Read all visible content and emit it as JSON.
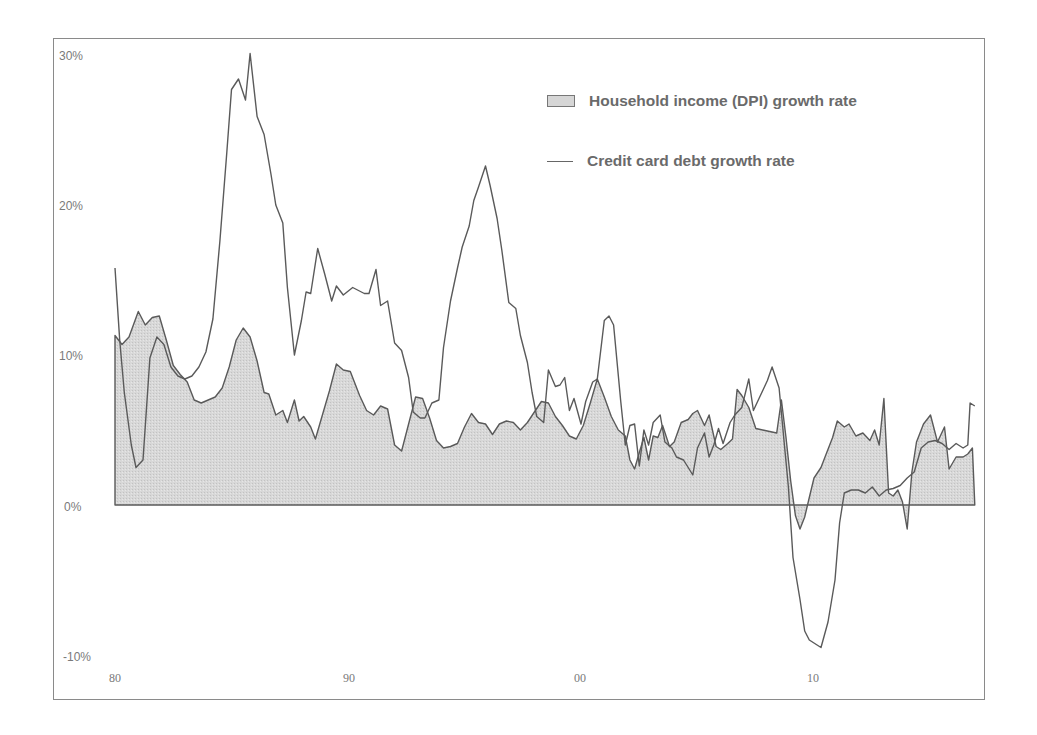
{
  "chart_data": {
    "type": "area+line",
    "title": "",
    "xlabel": "",
    "ylabel": "",
    "ylim": [
      -10,
      30
    ],
    "xlim": [
      1980,
      2017
    ],
    "grid": false,
    "legend_position": "top-right",
    "y_ticks": [
      "30%",
      "20%",
      "10%",
      "0%",
      "-10%"
    ],
    "x_ticks": [
      {
        "label": "80",
        "year": 1980
      },
      {
        "label": "90",
        "year": 1990
      },
      {
        "label": "00",
        "year": 2000
      },
      {
        "label": "10",
        "year": 2010
      }
    ],
    "series": [
      {
        "name": "Household income (DPI) growth rate",
        "type": "area",
        "fill": "#d6d6d6",
        "stroke": "#555555",
        "points": [
          [
            1980.0,
            11.3
          ],
          [
            1980.3,
            10.7
          ],
          [
            1980.6,
            11.2
          ],
          [
            1981.0,
            12.9
          ],
          [
            1981.3,
            12.0
          ],
          [
            1981.6,
            12.5
          ],
          [
            1981.9,
            12.6
          ],
          [
            1982.2,
            11.0
          ],
          [
            1982.5,
            9.3
          ],
          [
            1982.8,
            8.7
          ],
          [
            1983.1,
            8.2
          ],
          [
            1983.4,
            7.0
          ],
          [
            1983.7,
            6.8
          ],
          [
            1984.0,
            7.0
          ],
          [
            1984.3,
            7.2
          ],
          [
            1984.6,
            7.8
          ],
          [
            1984.9,
            9.2
          ],
          [
            1985.2,
            11.0
          ],
          [
            1985.5,
            11.8
          ],
          [
            1985.8,
            11.2
          ],
          [
            1986.1,
            9.6
          ],
          [
            1986.4,
            7.5
          ],
          [
            1986.6,
            7.4
          ],
          [
            1986.9,
            6.0
          ],
          [
            1987.2,
            6.3
          ],
          [
            1987.4,
            5.5
          ],
          [
            1987.7,
            7.0
          ],
          [
            1987.9,
            5.6
          ],
          [
            1988.1,
            5.9
          ],
          [
            1988.4,
            5.2
          ],
          [
            1988.6,
            4.4
          ],
          [
            1988.9,
            6.0
          ],
          [
            1989.2,
            7.6
          ],
          [
            1989.5,
            9.4
          ],
          [
            1989.8,
            9.0
          ],
          [
            1990.1,
            8.9
          ],
          [
            1990.5,
            7.3
          ],
          [
            1990.8,
            6.3
          ],
          [
            1991.1,
            6.0
          ],
          [
            1991.4,
            6.6
          ],
          [
            1991.7,
            6.4
          ],
          [
            1992.0,
            4.0
          ],
          [
            1992.3,
            3.6
          ],
          [
            1992.6,
            5.4
          ],
          [
            1992.9,
            7.2
          ],
          [
            1993.2,
            7.1
          ],
          [
            1993.5,
            5.8
          ],
          [
            1993.8,
            4.3
          ],
          [
            1994.1,
            3.8
          ],
          [
            1994.4,
            3.9
          ],
          [
            1994.7,
            4.1
          ],
          [
            1995.0,
            5.2
          ],
          [
            1995.3,
            6.1
          ],
          [
            1995.6,
            5.5
          ],
          [
            1995.9,
            5.4
          ],
          [
            1996.2,
            4.7
          ],
          [
            1996.5,
            5.4
          ],
          [
            1996.8,
            5.6
          ],
          [
            1997.1,
            5.5
          ],
          [
            1997.4,
            5.0
          ],
          [
            1997.7,
            5.5
          ],
          [
            1998.0,
            6.2
          ],
          [
            1998.3,
            6.9
          ],
          [
            1998.6,
            6.8
          ],
          [
            1998.9,
            5.9
          ],
          [
            1999.2,
            5.3
          ],
          [
            1999.5,
            4.6
          ],
          [
            1999.8,
            4.4
          ],
          [
            2000.1,
            5.3
          ],
          [
            2000.4,
            6.8
          ],
          [
            2000.7,
            8.4
          ],
          [
            2001.0,
            7.2
          ],
          [
            2001.3,
            5.9
          ],
          [
            2001.6,
            5.0
          ],
          [
            2001.9,
            4.6
          ],
          [
            2002.1,
            3.0
          ],
          [
            2002.3,
            2.4
          ],
          [
            2002.5,
            3.5
          ],
          [
            2002.7,
            4.5
          ],
          [
            2002.9,
            3.0
          ],
          [
            2003.1,
            4.6
          ],
          [
            2003.3,
            4.5
          ],
          [
            2003.5,
            5.3
          ],
          [
            2003.8,
            3.9
          ],
          [
            2004.0,
            4.2
          ],
          [
            2004.3,
            5.5
          ],
          [
            2004.6,
            5.7
          ],
          [
            2004.8,
            6.1
          ],
          [
            2005.0,
            6.3
          ],
          [
            2005.3,
            5.3
          ],
          [
            2005.5,
            6.0
          ],
          [
            2005.8,
            3.9
          ],
          [
            2006.0,
            3.7
          ],
          [
            2006.3,
            4.1
          ],
          [
            2006.5,
            4.4
          ],
          [
            2006.7,
            7.7
          ],
          [
            2006.9,
            7.3
          ],
          [
            2007.2,
            6.5
          ],
          [
            2007.5,
            5.1
          ],
          [
            2007.8,
            5.0
          ],
          [
            2008.1,
            4.9
          ],
          [
            2008.4,
            4.8
          ],
          [
            2008.6,
            7.0
          ],
          [
            2008.8,
            4.5
          ],
          [
            2009.0,
            1.6
          ],
          [
            2009.2,
            -0.7
          ],
          [
            2009.4,
            -1.6
          ],
          [
            2009.6,
            -0.8
          ],
          [
            2009.8,
            0.5
          ],
          [
            2010.0,
            1.8
          ],
          [
            2010.3,
            2.5
          ],
          [
            2010.5,
            3.3
          ],
          [
            2010.8,
            4.5
          ],
          [
            2011.0,
            5.6
          ],
          [
            2011.3,
            5.2
          ],
          [
            2011.5,
            5.4
          ],
          [
            2011.8,
            4.6
          ],
          [
            2012.1,
            4.8
          ],
          [
            2012.4,
            4.3
          ],
          [
            2012.6,
            5.0
          ],
          [
            2012.8,
            4.0
          ],
          [
            2013.0,
            7.1
          ],
          [
            2013.2,
            0.8
          ],
          [
            2013.4,
            0.6
          ],
          [
            2013.6,
            1.0
          ],
          [
            2013.8,
            0.2
          ],
          [
            2014.0,
            -1.6
          ],
          [
            2014.2,
            2.2
          ],
          [
            2014.4,
            4.2
          ],
          [
            2014.7,
            5.4
          ],
          [
            2015.0,
            6.0
          ],
          [
            2015.3,
            4.2
          ],
          [
            2015.6,
            5.2
          ],
          [
            2015.8,
            2.4
          ],
          [
            2016.1,
            3.2
          ],
          [
            2016.4,
            3.2
          ],
          [
            2016.6,
            3.4
          ],
          [
            2016.8,
            3.8
          ],
          [
            2016.9,
            0.0
          ]
        ]
      },
      {
        "name": "Credit card debt growth rate",
        "type": "line",
        "stroke": "#555555",
        "points": [
          [
            1980.0,
            15.8
          ],
          [
            1980.2,
            11.0
          ],
          [
            1980.4,
            7.5
          ],
          [
            1980.7,
            4.0
          ],
          [
            1980.9,
            2.5
          ],
          [
            1981.2,
            3.0
          ],
          [
            1981.5,
            9.8
          ],
          [
            1981.8,
            11.2
          ],
          [
            1982.1,
            10.7
          ],
          [
            1982.4,
            9.2
          ],
          [
            1982.7,
            8.6
          ],
          [
            1983.0,
            8.4
          ],
          [
            1983.3,
            8.6
          ],
          [
            1983.6,
            9.2
          ],
          [
            1983.9,
            10.2
          ],
          [
            1984.2,
            12.4
          ],
          [
            1984.5,
            17.6
          ],
          [
            1984.8,
            23.5
          ],
          [
            1985.0,
            27.7
          ],
          [
            1985.3,
            28.4
          ],
          [
            1985.6,
            27.0
          ],
          [
            1985.8,
            30.1
          ],
          [
            1986.1,
            25.9
          ],
          [
            1986.4,
            24.7
          ],
          [
            1986.7,
            22.0
          ],
          [
            1986.9,
            20.0
          ],
          [
            1987.2,
            18.8
          ],
          [
            1987.4,
            14.5
          ],
          [
            1987.7,
            10.0
          ],
          [
            1988.0,
            12.3
          ],
          [
            1988.2,
            14.2
          ],
          [
            1988.4,
            14.1
          ],
          [
            1988.7,
            17.1
          ],
          [
            1989.0,
            15.4
          ],
          [
            1989.3,
            13.6
          ],
          [
            1989.5,
            14.6
          ],
          [
            1989.8,
            14.0
          ],
          [
            1990.2,
            14.5
          ],
          [
            1990.7,
            14.1
          ],
          [
            1990.9,
            14.1
          ],
          [
            1991.2,
            15.7
          ],
          [
            1991.4,
            13.3
          ],
          [
            1991.7,
            13.6
          ],
          [
            1992.0,
            10.8
          ],
          [
            1992.3,
            10.3
          ],
          [
            1992.6,
            8.5
          ],
          [
            1992.8,
            6.2
          ],
          [
            1993.1,
            5.8
          ],
          [
            1993.3,
            5.8
          ],
          [
            1993.6,
            6.8
          ],
          [
            1993.9,
            7.0
          ],
          [
            1994.1,
            10.5
          ],
          [
            1994.4,
            13.6
          ],
          [
            1994.7,
            15.8
          ],
          [
            1994.9,
            17.2
          ],
          [
            1995.2,
            18.6
          ],
          [
            1995.4,
            20.3
          ],
          [
            1995.6,
            21.2
          ],
          [
            1995.9,
            22.6
          ],
          [
            1996.1,
            21.3
          ],
          [
            1996.4,
            19.1
          ],
          [
            1996.6,
            17.0
          ],
          [
            1996.9,
            13.5
          ],
          [
            1997.2,
            13.1
          ],
          [
            1997.4,
            11.3
          ],
          [
            1997.7,
            9.5
          ],
          [
            1997.9,
            7.5
          ],
          [
            1998.1,
            5.9
          ],
          [
            1998.4,
            5.5
          ],
          [
            1998.6,
            9.0
          ],
          [
            1998.9,
            7.9
          ],
          [
            1999.1,
            8.0
          ],
          [
            1999.3,
            8.5
          ],
          [
            1999.5,
            6.3
          ],
          [
            1999.7,
            7.1
          ],
          [
            2000.0,
            5.4
          ],
          [
            2000.2,
            6.9
          ],
          [
            2000.5,
            8.2
          ],
          [
            2000.7,
            8.4
          ],
          [
            2001.0,
            12.3
          ],
          [
            2001.2,
            12.6
          ],
          [
            2001.4,
            12.0
          ],
          [
            2001.7,
            7.0
          ],
          [
            2001.9,
            4.0
          ],
          [
            2002.1,
            5.3
          ],
          [
            2002.3,
            5.4
          ],
          [
            2002.5,
            2.6
          ],
          [
            2002.7,
            5.0
          ],
          [
            2002.9,
            4.0
          ],
          [
            2003.1,
            5.5
          ],
          [
            2003.4,
            6.0
          ],
          [
            2003.6,
            4.2
          ],
          [
            2003.9,
            3.8
          ],
          [
            2004.1,
            3.2
          ],
          [
            2004.4,
            3.0
          ],
          [
            2004.6,
            2.5
          ],
          [
            2004.8,
            2.0
          ],
          [
            2005.0,
            3.8
          ],
          [
            2005.3,
            4.8
          ],
          [
            2005.5,
            3.2
          ],
          [
            2005.7,
            4.0
          ],
          [
            2005.9,
            5.1
          ],
          [
            2006.1,
            4.1
          ],
          [
            2006.4,
            5.5
          ],
          [
            2006.6,
            6.0
          ],
          [
            2006.9,
            6.5
          ],
          [
            2007.2,
            8.4
          ],
          [
            2007.4,
            6.3
          ],
          [
            2007.7,
            7.3
          ],
          [
            2008.0,
            8.3
          ],
          [
            2008.2,
            9.2
          ],
          [
            2008.5,
            7.8
          ],
          [
            2008.7,
            4.5
          ],
          [
            2008.9,
            1.2
          ],
          [
            2009.1,
            -3.5
          ],
          [
            2009.4,
            -6.3
          ],
          [
            2009.6,
            -8.4
          ],
          [
            2009.8,
            -9.0
          ],
          [
            2010.1,
            -9.3
          ],
          [
            2010.3,
            -9.5
          ],
          [
            2010.6,
            -7.8
          ],
          [
            2010.9,
            -5.0
          ],
          [
            2011.1,
            -1.2
          ],
          [
            2011.3,
            0.8
          ],
          [
            2011.6,
            1.0
          ],
          [
            2011.9,
            1.0
          ],
          [
            2012.2,
            0.8
          ],
          [
            2012.5,
            1.2
          ],
          [
            2012.8,
            0.6
          ],
          [
            2013.1,
            1.0
          ],
          [
            2013.4,
            1.1
          ],
          [
            2013.7,
            1.3
          ],
          [
            2014.0,
            1.8
          ],
          [
            2014.3,
            2.2
          ],
          [
            2014.6,
            3.8
          ],
          [
            2014.9,
            4.2
          ],
          [
            2015.2,
            4.3
          ],
          [
            2015.5,
            4.1
          ],
          [
            2015.8,
            3.7
          ],
          [
            2016.1,
            4.1
          ],
          [
            2016.4,
            3.8
          ],
          [
            2016.6,
            4.0
          ],
          [
            2016.7,
            6.8
          ],
          [
            2016.9,
            6.6
          ]
        ]
      }
    ]
  },
  "legend": {
    "items": [
      {
        "label": "Household income (DPI) growth rate",
        "symbol": "area-swatch"
      },
      {
        "label": "Credit card debt growth rate",
        "symbol": "line-swatch"
      }
    ]
  },
  "axes": {
    "y_labels": [
      "30%",
      "20%",
      "10%",
      "0%",
      "-10%"
    ],
    "x_labels": [
      "80",
      "90",
      "00",
      "10"
    ]
  },
  "colors": {
    "area_fill": "#d6d6d6",
    "line": "#555555",
    "frame": "#8a8a8a",
    "text": "#7a7a7a"
  }
}
